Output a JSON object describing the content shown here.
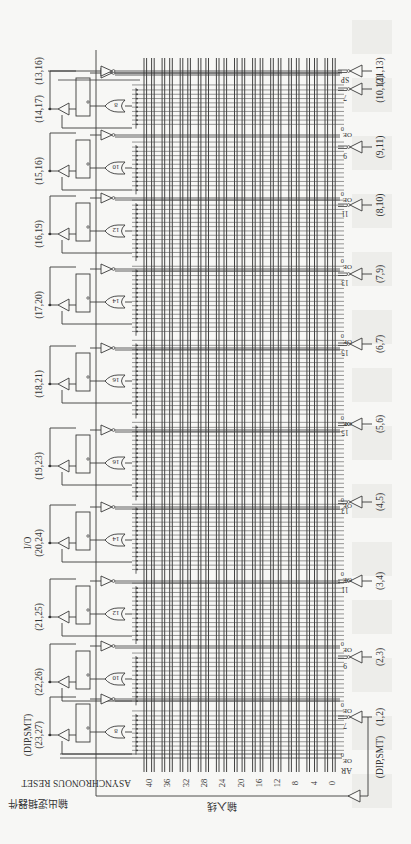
{
  "figure": {
    "type": "rotated PAL22V10 logic diagram",
    "orientation": "rotated 90 degrees",
    "colors": {
      "background": "#f7f7f5",
      "ink": "#333333"
    }
  },
  "bottom_left": {
    "reset_label": "ASYNCHRONOUS RESET",
    "output_logic_label": "输出逻辑器件"
  },
  "input_axis": {
    "title": "输入线",
    "ticks": [
      "40",
      "36",
      "32",
      "28",
      "24",
      "20",
      "16",
      "12",
      "8",
      "4",
      "0"
    ]
  },
  "macrocells": [
    {
      "pins": "(14,17)",
      "or_terms": "8",
      "y": 106
    },
    {
      "pins": "(15,16)",
      "or_terms": "10",
      "y": 168
    },
    {
      "pins": "(16,19)",
      "or_terms": "12",
      "y": 231
    },
    {
      "pins": "(17,20)",
      "or_terms": "14",
      "y": 302
    },
    {
      "pins": "(18,21)",
      "or_terms": "16",
      "y": 381
    },
    {
      "pins": "(19,23)",
      "or_terms": "16",
      "y": 463
    },
    {
      "pins": "(20,24)",
      "or_terms": "14",
      "y": 540,
      "prefix": "I/O"
    },
    {
      "pins": "(21,25)",
      "or_terms": "12",
      "y": 614
    },
    {
      "pins": "(22,26)",
      "or_terms": "10",
      "y": 679
    },
    {
      "pins": "(23,27)",
      "or_terms": "8",
      "y": 732,
      "prefix": "(DIP,SMT)"
    }
  ],
  "top_pin": {
    "pins": "(13,16)",
    "y": 71
  },
  "input_pins": [
    {
      "pins": "(11,13)",
      "term_label": "SP",
      "y": 71
    },
    {
      "pins": "(10,12)",
      "term_label": "7",
      "y": 89
    },
    {
      "pins": "(9,11)",
      "term_label": "9",
      "y": 147
    },
    {
      "pins": "(8,10)",
      "term_label": "11",
      "y": 205
    },
    {
      "pins": "(7,9)",
      "term_label": "13",
      "y": 274
    },
    {
      "pins": "(6,7)",
      "term_label": "15",
      "y": 344
    },
    {
      "pins": "(5,6)",
      "term_label": "15",
      "y": 424
    },
    {
      "pins": "(4,5)",
      "term_label": "13",
      "y": 502
    },
    {
      "pins": "(3,4)",
      "term_label": "11",
      "y": 581
    },
    {
      "pins": "(2,3)",
      "term_label": "9",
      "y": 657
    },
    {
      "pins": "(1,2)",
      "term_label": "7",
      "y": 717,
      "prefix": "(DIP,SMT)"
    }
  ],
  "oe_labels": {
    "zero": "0",
    "oe": "OE",
    "ar": "AR"
  }
}
